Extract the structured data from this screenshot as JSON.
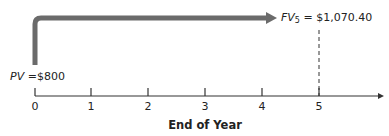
{
  "diagram": {
    "type": "timeline",
    "present_value": {
      "symbol": "PV",
      "equals": "=",
      "value": "$800"
    },
    "future_value": {
      "symbol": "FV",
      "subscript": "5",
      "equals": "=",
      "value": "$1,070.40"
    },
    "axis_title": "End of Year",
    "ticks": [
      "0",
      "1",
      "2",
      "3",
      "4",
      "5"
    ],
    "colors": {
      "flow_arrow": "#6b6b6b",
      "axis": "#333333"
    }
  }
}
